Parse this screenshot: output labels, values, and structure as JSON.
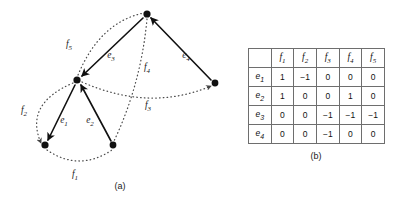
{
  "figure": {
    "panel_a": {
      "caption": "(a)",
      "caption_pos": {
        "x": 120,
        "y": 186
      },
      "nodes": [
        {
          "id": "n_top",
          "x": 147,
          "y": 14
        },
        {
          "id": "n_left",
          "x": 77,
          "y": 80
        },
        {
          "id": "n_right",
          "x": 215,
          "y": 83
        },
        {
          "id": "n_bl",
          "x": 45,
          "y": 145
        },
        {
          "id": "n_br",
          "x": 113,
          "y": 145
        }
      ],
      "solid_edges": [
        {
          "label": "e",
          "sub": "1",
          "from": "n_left",
          "to": "n_bl",
          "label_x": 64,
          "label_y": 122
        },
        {
          "label": "e",
          "sub": "2",
          "from": "n_br",
          "to": "n_left",
          "label_x": 90,
          "label_y": 122
        },
        {
          "label": "e",
          "sub": "3",
          "from": "n_top",
          "to": "n_left",
          "label_x": 111,
          "label_y": 57
        },
        {
          "label": "e",
          "sub": "4",
          "from": "n_right",
          "to": "n_top",
          "label_x": 186,
          "label_y": 57
        }
      ],
      "dotted_edges": [
        {
          "label": "f",
          "sub": "1",
          "label_x": 75,
          "label_y": 176
        },
        {
          "label": "f",
          "sub": "2",
          "label_x": 24,
          "label_y": 112
        },
        {
          "label": "f",
          "sub": "3",
          "label_x": 148,
          "label_y": 107
        },
        {
          "label": "f",
          "sub": "4",
          "label_x": 147,
          "label_y": 69
        },
        {
          "label": "f",
          "sub": "5",
          "label_x": 69,
          "label_y": 46
        }
      ]
    },
    "panel_b": {
      "caption": "(b)",
      "corner_label": "",
      "col_headers": [
        {
          "base": "f",
          "sub": "1"
        },
        {
          "base": "f",
          "sub": "2"
        },
        {
          "base": "f",
          "sub": "3"
        },
        {
          "base": "f",
          "sub": "4"
        },
        {
          "base": "f",
          "sub": "5"
        }
      ],
      "row_headers": [
        {
          "base": "e",
          "sub": "1"
        },
        {
          "base": "e",
          "sub": "2"
        },
        {
          "base": "e",
          "sub": "3"
        },
        {
          "base": "e",
          "sub": "4"
        }
      ],
      "rows": [
        [
          "1",
          "−1",
          "0",
          "0",
          "0"
        ],
        [
          "1",
          "0",
          "0",
          "1",
          "0"
        ],
        [
          "0",
          "0",
          "−1",
          "−1",
          "−1"
        ],
        [
          "0",
          "0",
          "−1",
          "0",
          "0"
        ]
      ]
    }
  },
  "colors": {
    "ink": "#1a1a1a",
    "rule": "#6e6e6e",
    "background": "#ffffff"
  }
}
